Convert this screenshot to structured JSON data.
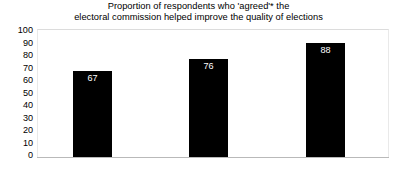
{
  "chart_data": {
    "type": "bar",
    "title": "Proportion of respondents who 'agreed'* the electoral commission helped improve the quality of elections",
    "title_lines": [
      "Proportion of respondents who 'agreed'* the",
      "electoral commission helped improve the quality of elections"
    ],
    "categories": [
      "Uganda",
      "Kenya",
      "Ghana"
    ],
    "values": [
      67,
      76,
      88
    ],
    "xlabel": "",
    "ylabel": "",
    "ylim": [
      0,
      100
    ],
    "ytick_labels": [
      "100",
      "90",
      "80",
      "70",
      "60",
      "50",
      "40",
      "30",
      "20",
      "10",
      "0"
    ],
    "ytick_values": [
      100,
      90,
      80,
      70,
      60,
      50,
      40,
      30,
      20,
      10,
      0
    ],
    "ytick_step": 10,
    "grid": false,
    "legend": null,
    "bar_color": "#000000",
    "value_label_color": "#ffffff",
    "background_color": "#ffffff",
    "axis_color": "#b9b9b9",
    "text_color": "#000000"
  }
}
